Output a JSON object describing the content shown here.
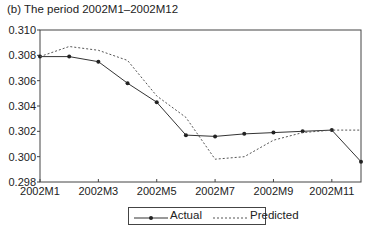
{
  "chart_data": {
    "type": "line",
    "title": "(b) The period 2002M1–2002M12",
    "xlabel": "",
    "ylabel": "",
    "x": [
      "2002M1",
      "2002M2",
      "2002M3",
      "2002M4",
      "2002M5",
      "2002M6",
      "2002M7",
      "2002M8",
      "2002M9",
      "2002M10",
      "2002M11",
      "2002M12"
    ],
    "x_tick_labels": [
      "2002M1",
      "2002M3",
      "2002M5",
      "2002M7",
      "2002M9",
      "2002M11"
    ],
    "y_tick_labels": [
      "0.298",
      "0.300",
      "0.302",
      "0.304",
      "0.306",
      "0.308",
      "0.310"
    ],
    "ylim": [
      0.298,
      0.31
    ],
    "grid": false,
    "legend_position": "bottom-center",
    "series": [
      {
        "name": "Actual",
        "style": "solid-with-markers",
        "color": "#333333",
        "values": [
          0.3079,
          0.3079,
          0.3075,
          0.3058,
          0.3043,
          0.3017,
          0.3016,
          0.3018,
          0.3019,
          0.302,
          0.3021,
          0.2996
        ]
      },
      {
        "name": "Predicted",
        "style": "dotted",
        "color": "#555555",
        "values": [
          0.3079,
          0.3087,
          0.3084,
          0.3076,
          0.3048,
          0.3031,
          0.2998,
          0.3,
          0.3013,
          0.3019,
          0.3021,
          0.3021
        ]
      }
    ]
  }
}
